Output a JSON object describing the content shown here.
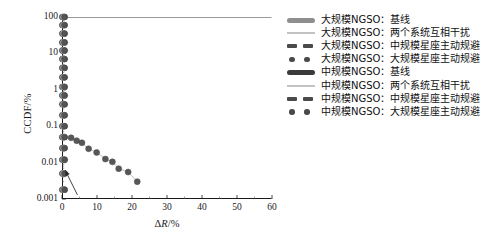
{
  "chart_data": {
    "type": "scatter",
    "title": "",
    "xlabel": "ΔR/%",
    "ylabel": "CCDF/%",
    "xlim": [
      0,
      60
    ],
    "ylim": [
      0.001,
      100
    ],
    "yscale": "log",
    "xscale": "linear",
    "grid": false,
    "legend_position": "right",
    "xticks": [
      "0",
      "10",
      "20",
      "30",
      "40",
      "50",
      "60"
    ],
    "xtick_values": [
      0,
      10,
      20,
      30,
      40,
      50,
      60
    ],
    "yticks": [
      "100",
      "10",
      "1",
      "0.1",
      "0.01",
      "0.001"
    ],
    "ytick_values": [
      100,
      10,
      1,
      0.1,
      0.01,
      0.001
    ],
    "annotation_arrow": {
      "label": "",
      "from_x": 4.4,
      "from_y": 0.0013,
      "to_x": 0.9,
      "to_y": 0.0062
    },
    "series": [
      {
        "name": "大规模NGSO：基线",
        "marker": "thick-bar",
        "color": "#8e8e8e",
        "x": [
          0.05,
          0.05,
          0.05,
          0.05,
          0.05,
          0.05,
          0.05,
          0.05,
          0.05,
          0.05,
          0.05,
          0.05,
          0.05,
          0.05,
          0.05,
          0.05,
          0.05,
          0.05
        ],
        "y": [
          100,
          60,
          35,
          20,
          12,
          7,
          4,
          2.2,
          1.2,
          0.7,
          0.4,
          0.2,
          0.1,
          0.05,
          0.025,
          0.012,
          0.005,
          0.0018
        ]
      },
      {
        "name": "大规模NGSO：两个系统互相干扰",
        "marker": "thin-line",
        "color": "#c2c2c2",
        "x": [
          0.3,
          0.3,
          0.3,
          0.3,
          0.3,
          0.3,
          0.3,
          0.3,
          0.3,
          0.3,
          0.3,
          0.3,
          0.3,
          0.3,
          0.3,
          0.3,
          0.3,
          0.3
        ],
        "y": [
          100,
          60,
          35,
          20,
          12,
          7,
          4,
          2.2,
          1.2,
          0.7,
          0.4,
          0.2,
          0.1,
          0.05,
          0.025,
          0.012,
          0.005,
          0.0018
        ]
      },
      {
        "name": "大规模NGSO：中规模星座主动规避",
        "marker": "dashed",
        "color": "#4a4a4a",
        "x": [
          0.55,
          0.55,
          0.55,
          0.55,
          0.55,
          0.55,
          0.55,
          0.55,
          0.55,
          0.55,
          0.55,
          0.55,
          0.55,
          0.55,
          0.55,
          0.55,
          0.55,
          0.55
        ],
        "y": [
          100,
          60,
          35,
          20,
          12,
          7,
          4,
          2.2,
          1.2,
          0.7,
          0.4,
          0.2,
          0.1,
          0.05,
          0.025,
          0.012,
          0.005,
          0.0018
        ]
      },
      {
        "name": "大规模NGSO：大规模星座主动规避",
        "marker": "dots",
        "color": "#4a4a4a",
        "x": [
          0.8,
          0.8,
          0.8,
          0.8,
          0.8,
          0.8,
          0.8,
          0.8,
          0.8,
          0.8,
          0.8,
          0.8,
          0.8,
          0.8,
          0.8,
          0.8,
          0.8,
          0.8
        ],
        "y": [
          100,
          60,
          35,
          20,
          12,
          7,
          4,
          2.2,
          1.2,
          0.7,
          0.4,
          0.2,
          0.1,
          0.05,
          0.025,
          0.012,
          0.005,
          0.0018
        ]
      },
      {
        "name": "中规模NGSO：基线",
        "marker": "thick-bar-dark",
        "color": "#3a3a3a",
        "x": [
          0.15,
          0.15,
          0.15,
          0.15,
          0.15,
          0.15,
          0.15,
          0.15,
          0.15,
          0.15,
          0.15,
          0.15,
          0.15,
          0.15,
          0.15,
          0.15,
          0.15,
          0.15
        ],
        "y": [
          100,
          60,
          35,
          20,
          12,
          7,
          4,
          2.2,
          1.2,
          0.7,
          0.4,
          0.2,
          0.1,
          0.05,
          0.025,
          0.012,
          0.005,
          0.0018
        ]
      },
      {
        "name": "中规模NGSO：两个系统互相干扰",
        "marker": "thin-line",
        "color": "#c2c2c2",
        "x": [
          0.4,
          0.4,
          0.4,
          0.4,
          0.4,
          0.4,
          0.4,
          0.4,
          0.4,
          0.4,
          0.4,
          0.4,
          0.4,
          0.4,
          0.4,
          0.4,
          0.4,
          0.4
        ],
        "y": [
          100,
          60,
          35,
          20,
          12,
          7,
          4,
          2.2,
          1.2,
          0.7,
          0.4,
          0.2,
          0.1,
          0.05,
          0.025,
          0.012,
          0.005,
          0.0018
        ]
      },
      {
        "name": "中规模NGSO：中规模星座主动规避",
        "marker": "dashed",
        "color": "#4a4a4a",
        "x": [
          0.65,
          0.65,
          0.65,
          0.65,
          0.65,
          0.65,
          0.65,
          0.65,
          0.65,
          0.65,
          0.65,
          0.65,
          0.65,
          0.65,
          0.65,
          0.65,
          0.65,
          0.65
        ],
        "y": [
          100,
          60,
          35,
          20,
          12,
          7,
          4,
          2.2,
          1.2,
          0.7,
          0.4,
          0.2,
          0.1,
          0.05,
          0.025,
          0.012,
          0.005,
          0.0018
        ]
      },
      {
        "name": "中规模NGSO：大规模星座主动规避",
        "marker": "dots",
        "color": "#4a4a4a",
        "x": [
          2.6,
          4.2,
          5.7,
          7.6,
          9.9,
          12.4,
          14.4,
          16.2,
          18.9,
          21.5
        ],
        "y": [
          0.048,
          0.04,
          0.035,
          0.024,
          0.019,
          0.0125,
          0.0105,
          0.0068,
          0.0055,
          0.003
        ]
      }
    ]
  },
  "axes": {
    "ylabel": "CCDF/%",
    "xlabel_prefix": "Δ",
    "xlabel_var": "R",
    "xlabel_suffix": "/%"
  },
  "legend": {
    "items": [
      {
        "label": "大规模NGSO：基线",
        "marker": "thick-bar"
      },
      {
        "label": "大规模NGSO：两个系统互相干扰",
        "marker": "thin-line"
      },
      {
        "label": "大规模NGSO：中规模星座主动规避",
        "marker": "dashed"
      },
      {
        "label": "大规模NGSO：大规模星座主动规避",
        "marker": "dots"
      },
      {
        "label": "中规模NGSO：基线",
        "marker": "thick-bar-dark"
      },
      {
        "label": "中规模NGSO：两个系统互相干扰",
        "marker": "thin-line"
      },
      {
        "label": "中规模NGSO：中规模星座主动规避",
        "marker": "dashed"
      },
      {
        "label": "中规模NGSO：大规模星座主动规避",
        "marker": "dots"
      }
    ]
  },
  "colors": {
    "axis": "#1a1a1a",
    "marker_dark": "#3a3a3a",
    "marker_mid": "#4a4a4a",
    "marker_gray": "#8e8e8e",
    "marker_light": "#c2c2c2",
    "background": "#ffffff"
  }
}
